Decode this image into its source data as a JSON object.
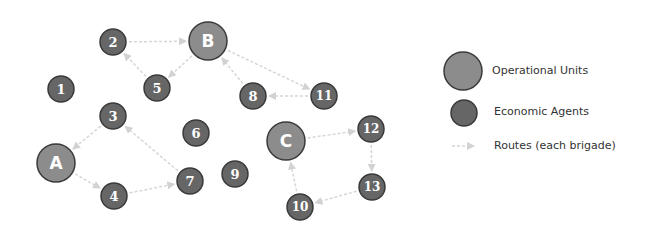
{
  "colors": {
    "operational_fill": "#8c8c8c",
    "agent_fill": "#666666",
    "stroke": "#3a3a3a",
    "route": "#d6d6d6",
    "label": "#ffffff"
  },
  "nodes": [
    {
      "id": "A",
      "type": "operational",
      "x": 56,
      "y": 163
    },
    {
      "id": "B",
      "type": "operational",
      "x": 208,
      "y": 41
    },
    {
      "id": "C",
      "type": "operational",
      "x": 286,
      "y": 141
    },
    {
      "id": "1",
      "type": "agent",
      "x": 61,
      "y": 89
    },
    {
      "id": "2",
      "type": "agent",
      "x": 113,
      "y": 42
    },
    {
      "id": "3",
      "type": "agent",
      "x": 113,
      "y": 116
    },
    {
      "id": "4",
      "type": "agent",
      "x": 114,
      "y": 196
    },
    {
      "id": "5",
      "type": "agent",
      "x": 157,
      "y": 88
    },
    {
      "id": "6",
      "type": "agent",
      "x": 196,
      "y": 133
    },
    {
      "id": "7",
      "type": "agent",
      "x": 190,
      "y": 181
    },
    {
      "id": "8",
      "type": "agent",
      "x": 253,
      "y": 96
    },
    {
      "id": "9",
      "type": "agent",
      "x": 235,
      "y": 174
    },
    {
      "id": "10",
      "type": "agent",
      "x": 300,
      "y": 207
    },
    {
      "id": "11",
      "type": "agent",
      "x": 324,
      "y": 96
    },
    {
      "id": "12",
      "type": "agent",
      "x": 371,
      "y": 129
    },
    {
      "id": "13",
      "type": "agent",
      "x": 372,
      "y": 187
    }
  ],
  "edges": [
    {
      "from": "2",
      "to": "B"
    },
    {
      "from": "B",
      "to": "5"
    },
    {
      "from": "5",
      "to": "2"
    },
    {
      "from": "B",
      "to": "11"
    },
    {
      "from": "11",
      "to": "8"
    },
    {
      "from": "8",
      "to": "B"
    },
    {
      "from": "3",
      "to": "A"
    },
    {
      "from": "A",
      "to": "4"
    },
    {
      "from": "4",
      "to": "7"
    },
    {
      "from": "7",
      "to": "3"
    },
    {
      "from": "C",
      "to": "12"
    },
    {
      "from": "12",
      "to": "13"
    },
    {
      "from": "13",
      "to": "10"
    },
    {
      "from": "10",
      "to": "C"
    }
  ],
  "legend": {
    "operational_units": "Operational Units",
    "economic_agents": "Economic Agents",
    "routes": "Routes (each brigade)"
  }
}
